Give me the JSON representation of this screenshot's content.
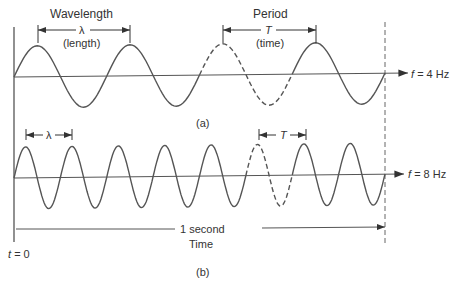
{
  "figure": {
    "panel_a": {
      "label": "(a)",
      "frequency_label": "f = 4 Hz",
      "frequency_var": "f",
      "frequency_value": "= 4 Hz",
      "cycles": 4,
      "wavelength": {
        "title": "Wavelength",
        "symbol": "λ",
        "note": "(length)"
      },
      "period": {
        "title": "Period",
        "symbol": "T",
        "note": "(time)"
      }
    },
    "panel_b": {
      "label": "(b)",
      "frequency_var": "f",
      "frequency_value": "= 8 Hz",
      "cycles": 8,
      "wavelength_symbol": "λ",
      "period_symbol": "T"
    },
    "time_axis": {
      "start_var": "t",
      "start_value": "= 0",
      "duration_label": "1 second",
      "axis_title": "Time"
    }
  },
  "colors": {
    "stroke": "#555555",
    "text": "#333333"
  }
}
